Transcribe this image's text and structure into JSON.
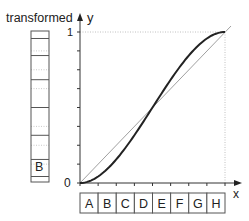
{
  "labels": {
    "column_title": "transformed",
    "y_axis": "y",
    "x_axis": "x",
    "y_one": "1",
    "origin": "0",
    "column_highlight": "B"
  },
  "bins": [
    "A",
    "B",
    "C",
    "D",
    "E",
    "F",
    "G",
    "H"
  ],
  "colors": {
    "curve": "#222222",
    "identity_line": "#9a9a9a",
    "axis": "#333333",
    "dotted_guide": "#b0b0b0",
    "box_stroke": "#555555"
  },
  "chart_data": {
    "type": "line",
    "title": "",
    "xlabel": "x",
    "ylabel": "y",
    "xlim": [
      0,
      1
    ],
    "ylim": [
      0,
      1
    ],
    "x_tick_count": 8,
    "y_tick_count": 8,
    "series": [
      {
        "name": "transform curve (smoothstep)",
        "x": [
          0,
          0.125,
          0.25,
          0.375,
          0.5,
          0.625,
          0.75,
          0.875,
          1
        ],
        "y": [
          0,
          0.043,
          0.156,
          0.316,
          0.5,
          0.684,
          0.844,
          0.957,
          1
        ]
      },
      {
        "name": "identity",
        "x": [
          0,
          1
        ],
        "y": [
          0,
          1
        ]
      }
    ],
    "x_bins": [
      "A",
      "B",
      "C",
      "D",
      "E",
      "F",
      "G",
      "H"
    ],
    "transformed_bin_edges": [
      0,
      0.043,
      0.156,
      0.316,
      0.5,
      0.684,
      0.844,
      0.957,
      1
    ],
    "annotations": [
      "transformed",
      "B"
    ]
  }
}
